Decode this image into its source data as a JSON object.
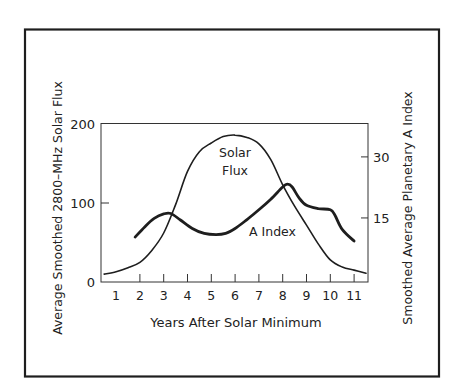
{
  "chart_data": {
    "type": "line",
    "title": "",
    "xlabel": "Years After Solar Minimum",
    "ylabel": "Average Smoothed 2800–MHz Solar Flux",
    "ylabel_right": "Smoothed Average Planetary A Index",
    "x_ticks": [
      1,
      2,
      3,
      4,
      5,
      6,
      7,
      8,
      9,
      10,
      11
    ],
    "x_tick_labels": [
      "1",
      "2",
      "3",
      "4",
      "5",
      "6",
      "7",
      "8",
      "9",
      "10",
      "11"
    ],
    "xlim": [
      0.4,
      11.6
    ],
    "y_ticks": [
      0,
      100,
      200
    ],
    "y_tick_labels": [
      "0",
      "100",
      "200"
    ],
    "ylim": [
      0,
      200
    ],
    "y_right_ticks": [
      15,
      30
    ],
    "y_right_tick_labels": [
      "15",
      "30"
    ],
    "y_right_lim": [
      0,
      39
    ],
    "grid": false,
    "legend": "none (inline curve labels)",
    "series": [
      {
        "name": "Solar Flux",
        "axis": "left",
        "label_lines": [
          "Solar",
          "Flux"
        ],
        "x": [
          0.5,
          1,
          1.5,
          2,
          2.5,
          3,
          3.5,
          4,
          4.5,
          5,
          5.5,
          6,
          6.5,
          7,
          7.5,
          8,
          8.5,
          9,
          9.5,
          10,
          10.5,
          11,
          11.5
        ],
        "values": [
          10,
          13,
          18,
          25,
          40,
          62,
          98,
          140,
          165,
          176,
          184,
          186,
          183,
          175,
          155,
          123,
          96,
          72,
          48,
          28,
          19,
          15,
          11
        ]
      },
      {
        "name": "A Index",
        "axis": "right",
        "label_lines": [
          "A Index"
        ],
        "x": [
          1.8,
          2.2,
          2.6,
          3.0,
          3.3,
          3.7,
          4.2,
          4.7,
          5.2,
          5.6,
          6.0,
          6.5,
          7.0,
          7.5,
          8.0,
          8.2,
          8.4,
          8.7,
          9.0,
          9.5,
          10.0,
          10.2,
          10.5,
          11.0
        ],
        "values": [
          10.3,
          12.8,
          14.9,
          16.0,
          16.1,
          14.5,
          12.4,
          11.2,
          10.9,
          11.2,
          12.4,
          14.6,
          17.0,
          19.6,
          22.6,
          23.3,
          22.6,
          19.8,
          18.1,
          17.3,
          17.0,
          15.6,
          12.2,
          9.3
        ]
      }
    ]
  },
  "labels": {
    "x_axis_title": "Years After Solar Minimum",
    "left_axis_title": "Average Smoothed 2800–MHz Solar Flux",
    "right_axis_title": "Smoothed Average Planetary A Index",
    "solar_flux_line1": "Solar",
    "solar_flux_line2": "Flux",
    "a_index_label": "A Index"
  },
  "colors": {
    "ink": "#1e1e1e",
    "background": "#ffffff"
  }
}
